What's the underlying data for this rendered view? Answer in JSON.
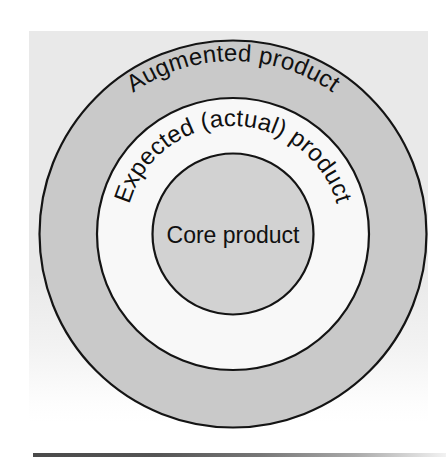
{
  "diagram": {
    "type": "concentric-circles",
    "rings": [
      {
        "id": "augmented",
        "label": "Augmented product",
        "level": 3,
        "fill": "#c9c9c9",
        "stroke": "#141414",
        "radius": 194,
        "label_orientation": "curved"
      },
      {
        "id": "expected",
        "label": "Expected (actual) product",
        "level": 2,
        "fill": "#f8f8f8",
        "stroke": "#141414",
        "radius": 136,
        "label_orientation": "curved"
      },
      {
        "id": "core",
        "label": "Core product",
        "level": 1,
        "fill": "#d2d2d2",
        "stroke": "#141414",
        "radius": 81,
        "label_orientation": "horizontal"
      }
    ],
    "center": {
      "x": 233,
      "y": 234
    },
    "backdrop_color": "#e9e9e9",
    "page_background": "#ffffff",
    "rule_color": "#4a4a4a"
  }
}
